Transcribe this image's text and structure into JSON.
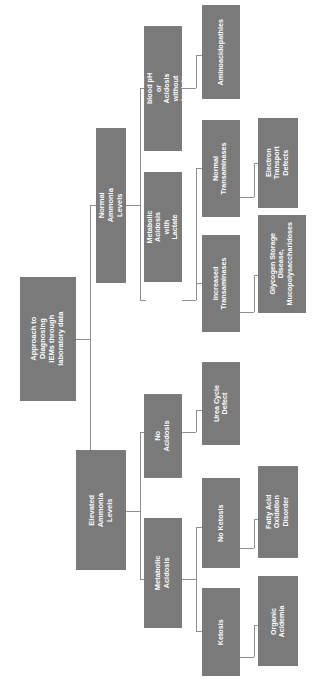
{
  "diagram": {
    "title": "Approach to Diagnosing IEMs through laboratory data",
    "orientation": "rotated-90-left-to-right-hierarchy",
    "node_color": "#7a7a7a",
    "text_color": "#ffffff",
    "connector_color": "#8e8e8e",
    "background_color": "#ffffff",
    "levels": 5,
    "nodes": {
      "root": "Approach to Diagnosing IEMs through laboratory data",
      "normal_ammonia": "Normal Ammonia Levels",
      "elevated_ammonia": "Elevated Ammonia Levels",
      "normal_ph": "Normal blood pH or Acidosis without Lactate",
      "metabolic_acidosis_lactate": "Metabolic Acidosis with Lactate",
      "aminoacidopathies": "Aminoacidopathies",
      "normal_transaminases": "Normal Transaminases",
      "increased_transaminases": "Increased Transaminases",
      "electron_transport": "Electron Transport Defects",
      "glycogen_storage": "Glycogen Storage Disease, Mucopolysaccharidoses",
      "no_acidosis": "No Acidosis",
      "metabolic_acidosis": "Metabolic Acidosis",
      "urea_cycle": "Urea Cycle Defect",
      "no_ketosis": "No Ketosis",
      "ketosis": "Ketosis",
      "fatty_acid": "Fatty Acid Oxidation Disorder",
      "organic_acidemia": "Organic Acidemia"
    },
    "edges": [
      {
        "from": "root",
        "to": "normal_ammonia"
      },
      {
        "from": "root",
        "to": "elevated_ammonia"
      },
      {
        "from": "normal_ammonia",
        "to": "normal_ph"
      },
      {
        "from": "normal_ammonia",
        "to": "metabolic_acidosis_lactate"
      },
      {
        "from": "normal_ph",
        "to": "aminoacidopathies"
      },
      {
        "from": "metabolic_acidosis_lactate",
        "to": "normal_transaminases"
      },
      {
        "from": "metabolic_acidosis_lactate",
        "to": "increased_transaminases"
      },
      {
        "from": "normal_transaminases",
        "to": "electron_transport"
      },
      {
        "from": "increased_transaminases",
        "to": "glycogen_storage"
      },
      {
        "from": "elevated_ammonia",
        "to": "no_acidosis"
      },
      {
        "from": "elevated_ammonia",
        "to": "metabolic_acidosis"
      },
      {
        "from": "no_acidosis",
        "to": "urea_cycle"
      },
      {
        "from": "metabolic_acidosis",
        "to": "no_ketosis"
      },
      {
        "from": "metabolic_acidosis",
        "to": "ketosis"
      },
      {
        "from": "no_ketosis",
        "to": "fatty_acid"
      },
      {
        "from": "ketosis",
        "to": "organic_acidemia"
      }
    ]
  }
}
